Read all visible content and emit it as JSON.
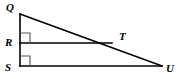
{
  "figure": {
    "background_color": "#ffffff",
    "stroke_color": "#000000",
    "right_angle_mark_color": "#555555",
    "width": 178,
    "height": 79,
    "points": {
      "Q": {
        "label": "Q",
        "x": 20,
        "y": 14
      },
      "R": {
        "label": "R",
        "x": 20,
        "y": 43
      },
      "S": {
        "label": "S",
        "x": 20,
        "y": 66
      },
      "T": {
        "label": "T",
        "x": 112,
        "y": 43
      },
      "U": {
        "label": "U",
        "x": 162,
        "y": 66
      }
    },
    "labels": {
      "Q": "Q",
      "R": "R",
      "S": "S",
      "T": "T",
      "U": "U"
    },
    "segments": [
      {
        "name": "QS",
        "from": "Q",
        "to": "S"
      },
      {
        "name": "SU",
        "from": "S",
        "to": "U"
      },
      {
        "name": "QU",
        "from": "Q",
        "to": "U"
      },
      {
        "name": "RT",
        "from": "R",
        "to": "T"
      }
    ],
    "right_angles": [
      {
        "name": "angle-at-R",
        "vertex": "R",
        "size": 10
      },
      {
        "name": "angle-at-S",
        "vertex": "S",
        "size": 10
      }
    ]
  }
}
